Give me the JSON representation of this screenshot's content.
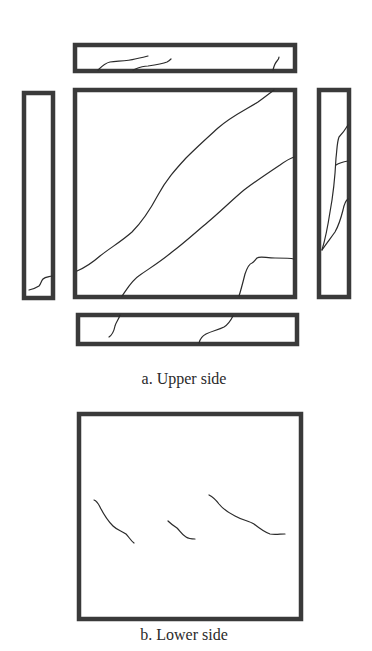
{
  "figure": {
    "panel_color": "#3a3a3a",
    "crack_color": "#2b2b2b",
    "upper_side": {
      "caption": "a. Upper side",
      "panels": [
        "top-strip",
        "left-strip",
        "main-square",
        "right-strip",
        "bottom-strip"
      ]
    },
    "lower_side": {
      "caption": "b. Lower side",
      "panels": [
        "lower-square"
      ],
      "crack_count": 3
    }
  }
}
